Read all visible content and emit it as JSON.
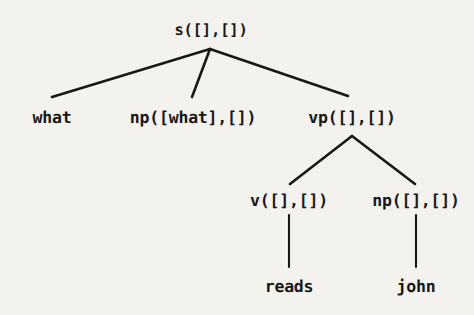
{
  "figure": {
    "kind": "parse-tree-diagram",
    "background_color": "#f3f2ef",
    "stroke_color": "#181818",
    "text_color": "#181818",
    "width": 474,
    "height": 315
  },
  "tree": {
    "root": {
      "label": "s([],[])",
      "x": 211,
      "y": 30
    },
    "level2": [
      {
        "label": "what",
        "x": 52,
        "y": 117
      },
      {
        "label": "np([what],[])",
        "x": 193,
        "y": 117
      },
      {
        "label": "vp([],[])",
        "x": 352,
        "y": 117
      }
    ],
    "level3": [
      {
        "label": "v([],[])",
        "x": 289,
        "y": 200
      },
      {
        "label": "np([],[])",
        "x": 416,
        "y": 200
      }
    ],
    "leaves": [
      {
        "label": "reads",
        "x": 289,
        "y": 286
      },
      {
        "label": "john",
        "x": 416,
        "y": 286
      }
    ]
  },
  "edges": [
    {
      "from": "s([],[])",
      "to": "what",
      "x1": 210,
      "y1": 49,
      "x2": 52,
      "y2": 97
    },
    {
      "from": "s([],[])",
      "to": "np([what],[])",
      "x1": 210,
      "y1": 49,
      "x2": 192,
      "y2": 97
    },
    {
      "from": "s([],[])",
      "to": "vp([],[])",
      "x1": 210,
      "y1": 49,
      "x2": 348,
      "y2": 96
    },
    {
      "from": "vp([],[])",
      "to": "v([],[])",
      "x1": 352,
      "y1": 136,
      "x2": 290,
      "y2": 184
    },
    {
      "from": "vp([],[])",
      "to": "np([],[])",
      "x1": 352,
      "y1": 136,
      "x2": 415,
      "y2": 184
    },
    {
      "from": "v([],[])",
      "to": "reads",
      "x1": 289,
      "y1": 215,
      "x2": 289,
      "y2": 267
    },
    {
      "from": "np([],[])",
      "to": "john",
      "x1": 416,
      "y1": 215,
      "x2": 416,
      "y2": 267
    }
  ]
}
